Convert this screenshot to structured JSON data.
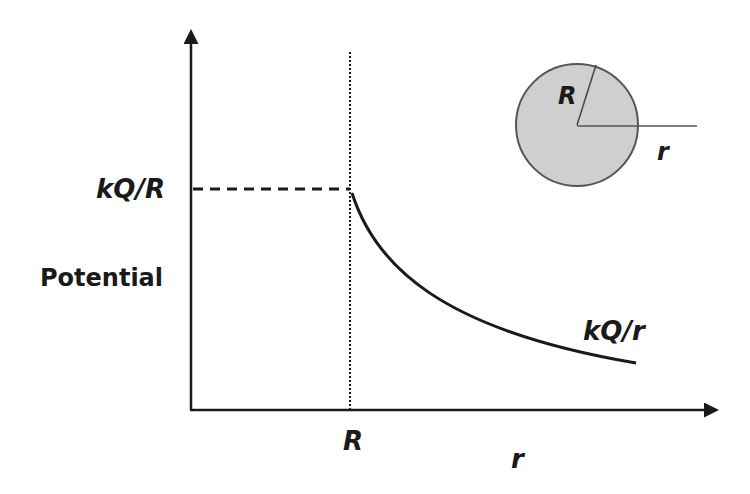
{
  "diagram": {
    "y_axis_label": "Potential",
    "x_axis_label": "r",
    "y_tick_label": "kQ/R",
    "x_tick_label": "R",
    "curve_label": "kQ/r",
    "inset": {
      "sphere_radius_label": "R",
      "distance_label": "r",
      "sphere_fill": "#cfcfcf"
    },
    "colors": {
      "line": "#1a1a1a",
      "background": "#ffffff"
    }
  }
}
